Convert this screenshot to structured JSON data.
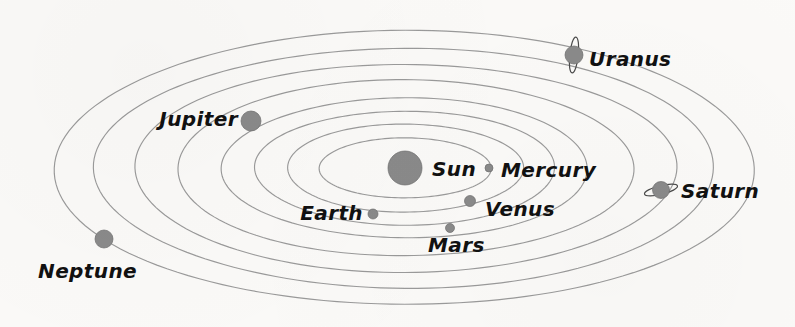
{
  "figure": {
    "background_color": "#fbfaf8",
    "orbit_color": "#9a9a9a",
    "body_color": "#8a8a8a",
    "ring_color": "#4a4a4a",
    "label_color": "#111111",
    "width": 795,
    "height": 327
  },
  "chart_data": {
    "type": "diagram",
    "subtitle": "",
    "xlabel": "",
    "ylabel": "",
    "center": {
      "cx": 405,
      "cy": 168
    },
    "legend": "none",
    "grid": false,
    "orbits": [
      {
        "name": "Mercury",
        "rx": 86,
        "ry": 30,
        "index": 1
      },
      {
        "name": "Venus",
        "rx": 118,
        "ry": 44,
        "index": 2
      },
      {
        "name": "Earth",
        "rx": 150,
        "ry": 57,
        "index": 3
      },
      {
        "name": "Mars",
        "rx": 183,
        "ry": 70,
        "index": 4
      },
      {
        "name": "Jupiter",
        "rx": 228,
        "ry": 88,
        "index": 5
      },
      {
        "name": "Saturn",
        "rx": 271,
        "ry": 104,
        "index": 6
      },
      {
        "name": "Uranus",
        "rx": 310,
        "ry": 120,
        "index": 7
      },
      {
        "name": "Neptune",
        "rx": 350,
        "ry": 137,
        "index": 8
      }
    ],
    "bodies": [
      {
        "name": "Sun",
        "label": "Sun",
        "cx": 405,
        "cy": 168,
        "r": 17,
        "rings": "none",
        "label_x": 432,
        "label_y": 176,
        "anchor": "start",
        "font_size": 20
      },
      {
        "name": "Mercury",
        "label": "Mercury",
        "cx": 489,
        "cy": 168,
        "r": 4,
        "rings": "none",
        "label_x": 501,
        "label_y": 177,
        "anchor": "start",
        "font_size": 20
      },
      {
        "name": "Venus",
        "label": "Venus",
        "cx": 470,
        "cy": 201,
        "r": 5.5,
        "rings": "none",
        "label_x": 485,
        "label_y": 216,
        "anchor": "start",
        "font_size": 20
      },
      {
        "name": "Earth",
        "label": "Earth",
        "cx": 373,
        "cy": 214,
        "r": 5,
        "rings": "none",
        "label_x": 363,
        "label_y": 220,
        "anchor": "end",
        "font_size": 20
      },
      {
        "name": "Mars",
        "label": "Mars",
        "cx": 450,
        "cy": 228,
        "r": 4.5,
        "rings": "none",
        "label_x": 428,
        "label_y": 252,
        "anchor": "start",
        "font_size": 20
      },
      {
        "name": "Jupiter",
        "label": "Jupiter",
        "cx": 251,
        "cy": 121,
        "r": 10,
        "rings": "none",
        "label_x": 238,
        "label_y": 126,
        "anchor": "end",
        "font_size": 20
      },
      {
        "name": "Saturn",
        "label": "Saturn",
        "cx": 661,
        "cy": 190,
        "r": 8.5,
        "rings": "horizontal",
        "label_x": 681,
        "label_y": 198,
        "anchor": "start",
        "font_size": 20
      },
      {
        "name": "Uranus",
        "label": "Uranus",
        "cx": 574,
        "cy": 55,
        "r": 9,
        "rings": "vertical",
        "label_x": 589,
        "label_y": 66,
        "anchor": "start",
        "font_size": 20
      },
      {
        "name": "Neptune",
        "label": "Neptune",
        "cx": 104,
        "cy": 239,
        "r": 9,
        "rings": "none",
        "label_x": 38,
        "label_y": 278,
        "anchor": "start",
        "font_size": 20
      }
    ],
    "labels": [
      "Sun",
      "Mercury",
      "Venus",
      "Earth",
      "Mars",
      "Jupiter",
      "Saturn",
      "Uranus",
      "Neptune"
    ]
  }
}
